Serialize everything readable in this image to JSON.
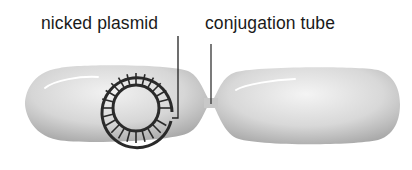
{
  "diagram": {
    "labels": {
      "plasmid": "nicked plasmid",
      "tube": "conjugation tube"
    },
    "elements": {
      "left_cell": "donor cell",
      "right_cell": "recipient cell",
      "plasmid": "circular plasmid (nicked)",
      "bridge": "conjugation tube"
    },
    "colors": {
      "cell_fill_light": "#f0f0f0",
      "cell_fill_dark": "#9a9a9a",
      "plasmid_stroke": "#2a2a2a",
      "leader_line": "#222222",
      "text": "#1a1a1a"
    }
  }
}
